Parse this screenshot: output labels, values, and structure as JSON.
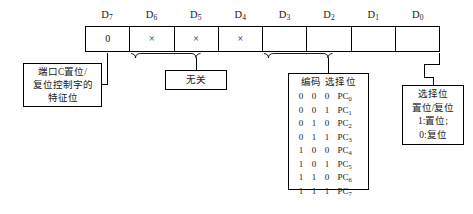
{
  "diagram": {
    "bit_labels": [
      {
        "name": "D",
        "index": "7"
      },
      {
        "name": "D",
        "index": "6"
      },
      {
        "name": "D",
        "index": "5"
      },
      {
        "name": "D",
        "index": "4"
      },
      {
        "name": "D",
        "index": "3"
      },
      {
        "name": "D",
        "index": "2"
      },
      {
        "name": "D",
        "index": "1"
      },
      {
        "name": "D",
        "index": "0"
      }
    ],
    "register_cells": [
      {
        "value": "0"
      },
      {
        "value": "×"
      },
      {
        "value": "×"
      },
      {
        "value": "×"
      },
      {
        "value": ""
      },
      {
        "value": ""
      },
      {
        "value": ""
      },
      {
        "value": ""
      }
    ],
    "feature_box": {
      "lines": [
        "端口C置位/",
        "复位控制字的",
        "特征位"
      ]
    },
    "dontcare_box": {
      "lines": [
        "无关"
      ]
    },
    "encoding_box": {
      "header": "编码  选择位",
      "header_code_label": "编码",
      "header_select_label": "选择位",
      "rows": [
        {
          "bits": [
            "0",
            "0",
            "0"
          ],
          "select": "PC",
          "select_index": "0"
        },
        {
          "bits": [
            "0",
            "0",
            "1"
          ],
          "select": "PC",
          "select_index": "1"
        },
        {
          "bits": [
            "0",
            "1",
            "0"
          ],
          "select": "PC",
          "select_index": "2"
        },
        {
          "bits": [
            "0",
            "1",
            "1"
          ],
          "select": "PC",
          "select_index": "3"
        },
        {
          "bits": [
            "1",
            "0",
            "0"
          ],
          "select": "PC",
          "select_index": "4"
        },
        {
          "bits": [
            "1",
            "0",
            "1"
          ],
          "select": "PC",
          "select_index": "5"
        },
        {
          "bits": [
            "1",
            "1",
            "0"
          ],
          "select": "PC",
          "select_index": "6"
        },
        {
          "bits": [
            "1",
            "1",
            "1"
          ],
          "select": "PC",
          "select_index": "7"
        }
      ]
    },
    "select_box": {
      "lines": [
        "选择位",
        "置位/复位",
        "1:置位;",
        "0:复位"
      ]
    },
    "colors": {
      "line": "#000000",
      "background": "#ffffff",
      "text": "#1a1a1a"
    }
  }
}
